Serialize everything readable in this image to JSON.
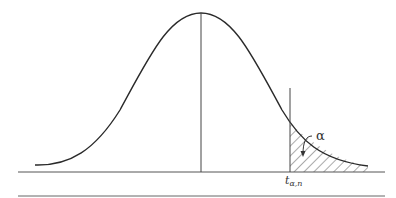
{
  "diagram": {
    "type": "t-distribution-upper-tail",
    "labels": {
      "alpha": "α",
      "t_main": "t",
      "t_sub": "α,n"
    },
    "colors": {
      "stroke": "#2a2a2a",
      "axis": "#555555",
      "background": "#ffffff"
    }
  }
}
